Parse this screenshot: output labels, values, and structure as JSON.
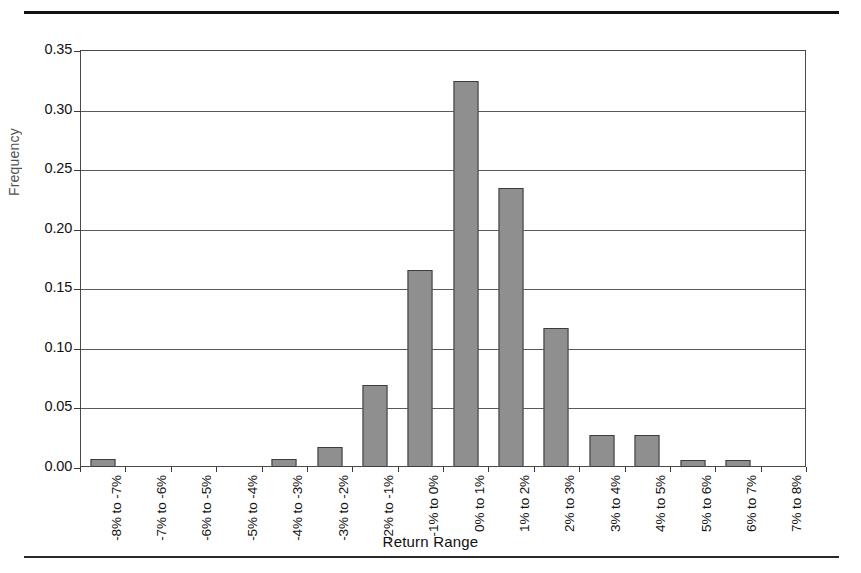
{
  "figure": {
    "yaxis_title": "Frequency",
    "xaxis_title": "Return Range",
    "top_rule": "",
    "bottom_rule": ""
  },
  "chart_data": {
    "type": "bar",
    "title": "",
    "xlabel": "Return Range",
    "ylabel": "Frequency",
    "ylim": [
      0.0,
      0.35
    ],
    "yticks": [
      "0.00",
      "0.05",
      "0.10",
      "0.15",
      "0.20",
      "0.25",
      "0.30",
      "0.35"
    ],
    "ytick_values": [
      0.0,
      0.05,
      0.1,
      0.15,
      0.2,
      0.25,
      0.3,
      0.35
    ],
    "grid": true,
    "legend": "none",
    "bar_color": "#8f8f8f",
    "bar_edge_color": "#3d3d3d",
    "categories": [
      "-8% to -7%",
      "-7% to -6%",
      "-6% to -5%",
      "-5% to -4%",
      "-4% to -3%",
      "-3% to -2%",
      "-2% to -1%",
      "-1% to 0%",
      "0% to 1%",
      "1% to 2%",
      "2% to 3%",
      "3% to 4%",
      "4% to 5%",
      "5% to 6%",
      "6% to 7%",
      "7% to 8%"
    ],
    "values": [
      0.007,
      0.0,
      0.0,
      0.0,
      0.007,
      0.017,
      0.069,
      0.165,
      0.324,
      0.234,
      0.117,
      0.027,
      0.027,
      0.006,
      0.006,
      0.0
    ]
  }
}
